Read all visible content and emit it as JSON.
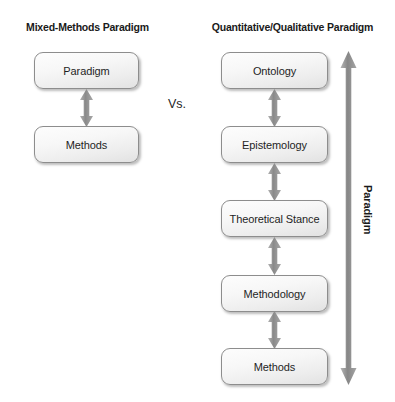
{
  "diagram": {
    "title_left": "Mixed-Methods Paradigm",
    "title_right": "Quantitative/Qualitative Paradigm",
    "vs_label": "Vs.",
    "paradigm_bracket_label": "Paradigm",
    "left_column": {
      "heading": "Mixed-Methods Paradigm",
      "nodes": [
        {
          "label": "Paradigm"
        },
        {
          "label": "Methods"
        }
      ],
      "connectors": [
        {
          "from": "Paradigm",
          "to": "Methods",
          "type": "double-headed-arrow"
        }
      ]
    },
    "right_column": {
      "heading": "Quantitative/Qualitative Paradigm",
      "nodes": [
        {
          "label": "Ontology"
        },
        {
          "label": "Epistemology"
        },
        {
          "label": "Theoretical Stance"
        },
        {
          "label": "Methodology"
        },
        {
          "label": "Methods"
        }
      ],
      "connectors": [
        {
          "from": "Ontology",
          "to": "Epistemology",
          "type": "double-headed-arrow"
        },
        {
          "from": "Epistemology",
          "to": "Theoretical Stance",
          "type": "double-headed-arrow"
        },
        {
          "from": "Theoretical Stance",
          "to": "Methodology",
          "type": "double-headed-arrow"
        },
        {
          "from": "Methodology",
          "to": "Methods",
          "type": "double-headed-arrow"
        }
      ],
      "span_arrow": {
        "label": "Paradigm",
        "type": "double-headed-arrow",
        "orientation": "vertical",
        "spans_from": "Ontology",
        "spans_to": "Methods"
      }
    },
    "colors": {
      "arrow": "#8c8c8c",
      "node_border": "#8d8d8d",
      "node_fill_top": "#fdfdfd",
      "node_fill_bottom": "#e2e2e2",
      "text": "#1f1f1f",
      "background": "#ffffff"
    }
  }
}
